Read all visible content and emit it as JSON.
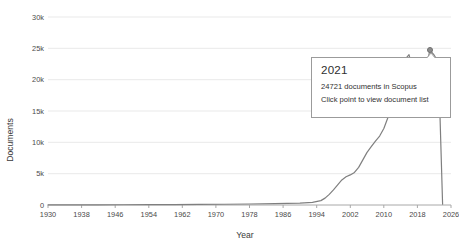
{
  "chart_data": {
    "type": "line",
    "title": "",
    "xlabel": "Year",
    "ylabel": "Documents",
    "xlim": [
      1930,
      2026
    ],
    "ylim": [
      0,
      30000
    ],
    "grid": true,
    "legend": null,
    "xticks": [
      "1930",
      "1938",
      "1946",
      "1954",
      "1962",
      "1970",
      "1978",
      "1986",
      "1994",
      "2002",
      "2010",
      "2018",
      "2026"
    ],
    "yticks": [
      "0",
      "5k",
      "10k",
      "15k",
      "20k",
      "25k",
      "30k"
    ],
    "ytick_values": [
      0,
      5000,
      10000,
      15000,
      20000,
      25000,
      30000
    ],
    "x": [
      1930,
      1936,
      1942,
      1948,
      1954,
      1960,
      1966,
      1972,
      1978,
      1984,
      1990,
      1993,
      1995,
      1996,
      1997,
      1998,
      1999,
      2000,
      2001,
      2002,
      2003,
      2004,
      2005,
      2006,
      2007,
      2008,
      2009,
      2010,
      2011,
      2012,
      2013,
      2014,
      2015,
      2016,
      2017,
      2018,
      2019,
      2020,
      2021,
      2022,
      2023,
      2024
    ],
    "values": [
      20,
      25,
      30,
      40,
      55,
      70,
      90,
      120,
      160,
      210,
      300,
      420,
      700,
      1100,
      1700,
      2400,
      3200,
      4000,
      4500,
      4800,
      5200,
      6000,
      7200,
      8400,
      9300,
      10200,
      11000,
      12200,
      14000,
      16500,
      19000,
      21500,
      23200,
      24000,
      21200,
      22400,
      20600,
      22000,
      24721,
      23900,
      22800,
      120
    ],
    "highlighted_point": {
      "x": 2021,
      "y": 24721,
      "label": "2021"
    },
    "annotations": [
      "24721 documents in Scopus",
      "Click point to view document list"
    ]
  },
  "tooltip": {
    "title": "2021",
    "line1": "24721 documents in Scopus",
    "line2": "Click point to view document list"
  },
  "colors": {
    "line": "#7f7f7f",
    "grid": "#e9e9e9",
    "axis": "#a8a8a8",
    "text": "#3c3c3c",
    "tooltip_border": "#9b9b9b",
    "marker": "#8d8d8d",
    "background": "#ffffff"
  },
  "axis": {
    "y_title": "Documents",
    "x_title": "Year"
  }
}
